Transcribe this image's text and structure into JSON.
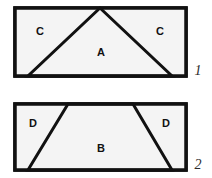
{
  "page": {
    "background_color": "#ffffff",
    "width": 212,
    "height": 178
  },
  "style": {
    "stroke_color": "#111111",
    "fill_color": "#f4f4f4",
    "label_color": "#111111",
    "number_color": "#2a2a2a",
    "outer_stroke_width": 3.5,
    "inner_stroke_width": 3
  },
  "figures": [
    {
      "id": "figure-1",
      "number": "1",
      "number_position": {
        "x": 198,
        "y": 72
      },
      "outline": {
        "x": 15,
        "y": 8,
        "width": 171,
        "height": 68
      },
      "shapes": [
        {
          "id": "triangle-a",
          "label": "A",
          "points": "100,8 172,76 28,76",
          "label_position": {
            "x": 101,
            "y": 53
          }
        },
        {
          "id": "corner-c-left",
          "label": "C",
          "points": "15,8 100,8 28,76 15,76",
          "label_position": {
            "x": 40,
            "y": 32
          }
        },
        {
          "id": "corner-c-right",
          "label": "C",
          "points": "100,8 186,8 186,76 172,76",
          "label_position": {
            "x": 160,
            "y": 32
          }
        }
      ]
    },
    {
      "id": "figure-2",
      "number": "2",
      "number_position": {
        "x": 198,
        "y": 166
      },
      "outline": {
        "x": 15,
        "y": 104,
        "width": 171,
        "height": 66
      },
      "shapes": [
        {
          "id": "trapezoid-b",
          "label": "B",
          "points": "68,104 133,104 172,170 28,170",
          "label_position": {
            "x": 101,
            "y": 149
          }
        },
        {
          "id": "corner-d-left",
          "label": "D",
          "points": "15,104 68,104 28,170 15,170",
          "label_position": {
            "x": 33,
            "y": 124
          }
        },
        {
          "id": "corner-d-right",
          "label": "D",
          "points": "133,104 186,104 186,170 172,170",
          "label_position": {
            "x": 166,
            "y": 124
          }
        }
      ]
    }
  ]
}
